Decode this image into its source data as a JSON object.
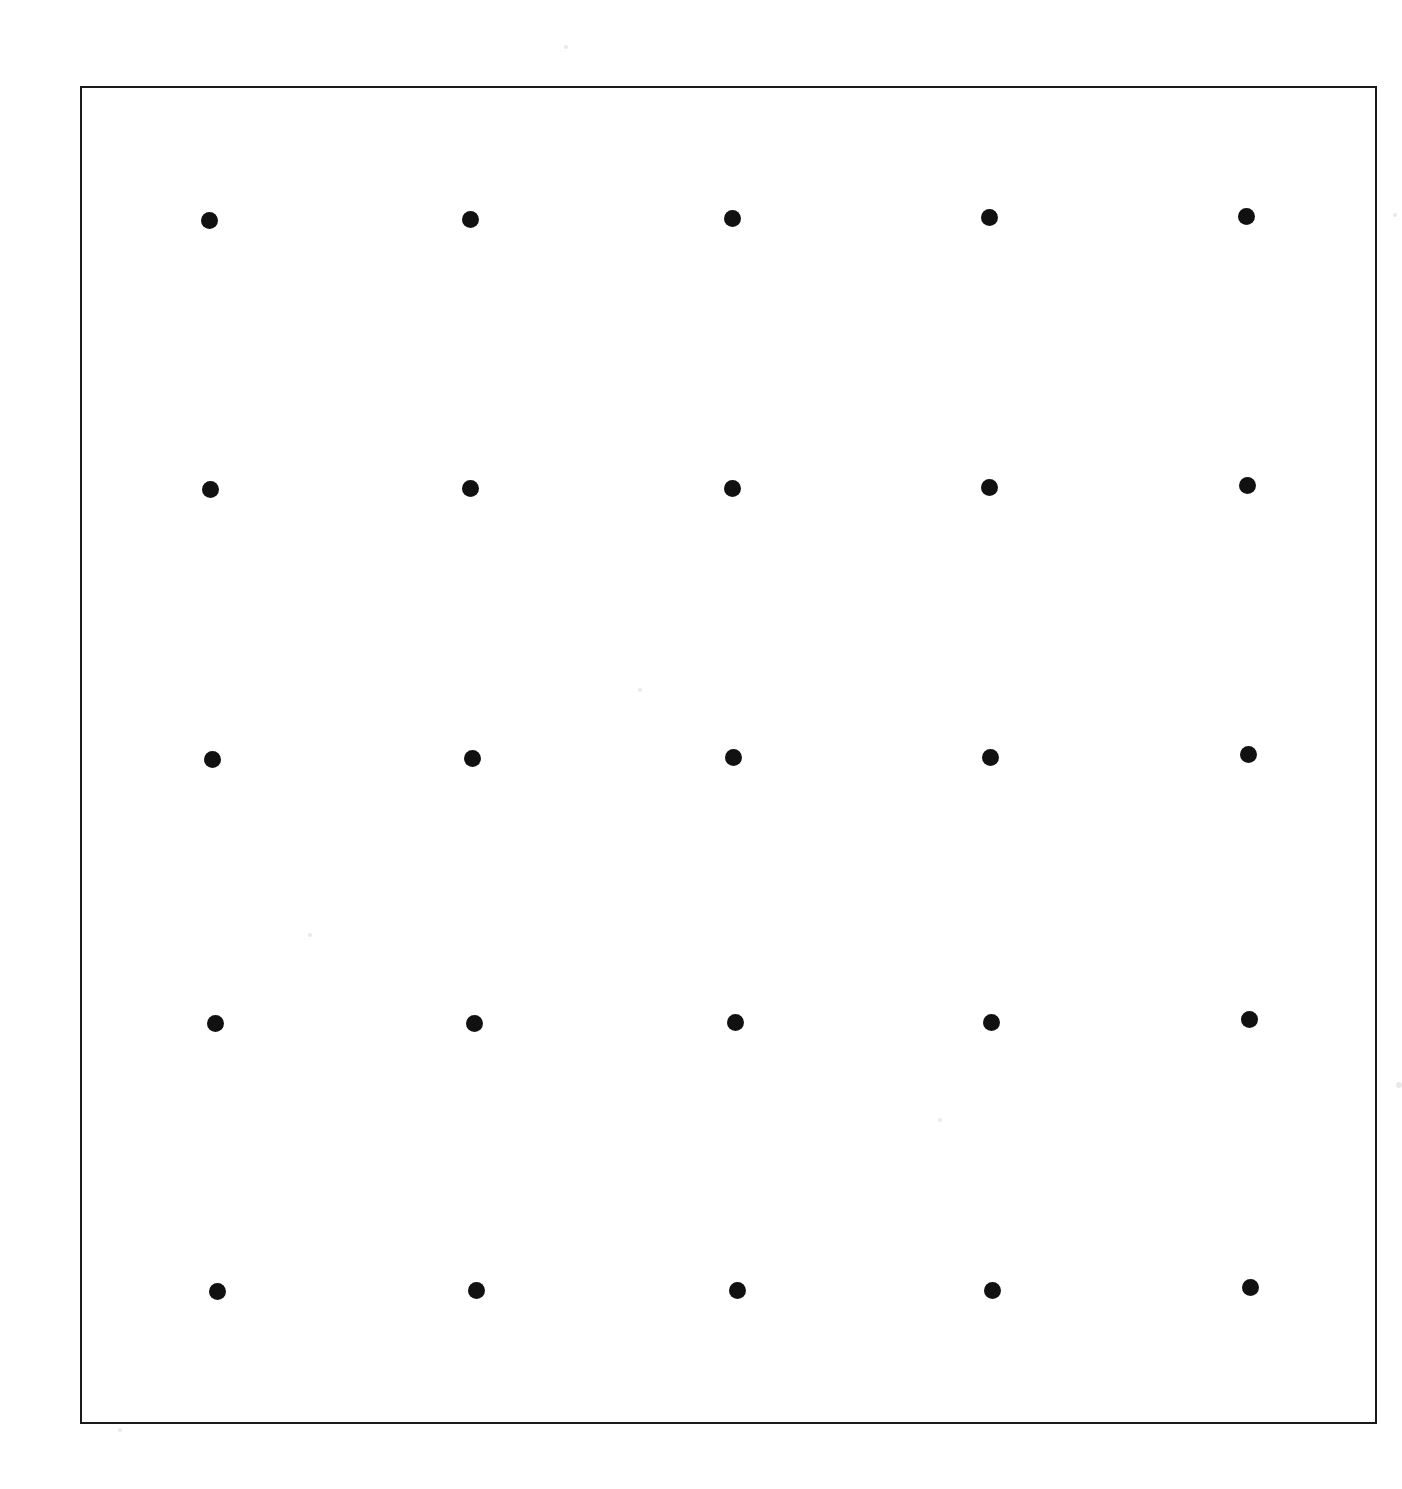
{
  "figure": {
    "name": "dot-grid-figure",
    "caption": "",
    "background_color": "#ffffff",
    "frame": {
      "stroke_color": "#1a1a1a",
      "stroke_width_px": 2,
      "left_px": 80,
      "top_px": 86,
      "width_px": 1297,
      "height_px": 1338
    },
    "dot": {
      "color": "#111111",
      "diameter_px": 17,
      "shape": "circle"
    }
  },
  "chart_data": {
    "type": "scatter",
    "title": "",
    "subtitle": "",
    "xlabel": "",
    "ylabel": "",
    "grid": false,
    "legend": null,
    "axis_visible": false,
    "tick_labels_x": [],
    "tick_labels_y": [],
    "xlim": [
      80,
      1377
    ],
    "ylim": [
      86,
      1424
    ],
    "marker": "filled-circle",
    "marker_color": "#111111",
    "marker_size_px": 17,
    "rows": 5,
    "columns": 5,
    "points": [
      {
        "row": 1,
        "col": 1,
        "x": 209,
        "y": 220
      },
      {
        "row": 1,
        "col": 2,
        "x": 470,
        "y": 219
      },
      {
        "row": 1,
        "col": 3,
        "x": 732,
        "y": 218
      },
      {
        "row": 1,
        "col": 4,
        "x": 989,
        "y": 217
      },
      {
        "row": 1,
        "col": 5,
        "x": 1246,
        "y": 216
      },
      {
        "row": 2,
        "col": 1,
        "x": 210,
        "y": 489
      },
      {
        "row": 2,
        "col": 2,
        "x": 470,
        "y": 488
      },
      {
        "row": 2,
        "col": 3,
        "x": 732,
        "y": 488
      },
      {
        "row": 2,
        "col": 4,
        "x": 989,
        "y": 487
      },
      {
        "row": 2,
        "col": 5,
        "x": 1247,
        "y": 485
      },
      {
        "row": 3,
        "col": 1,
        "x": 212,
        "y": 759
      },
      {
        "row": 3,
        "col": 2,
        "x": 472,
        "y": 758
      },
      {
        "row": 3,
        "col": 3,
        "x": 733,
        "y": 757
      },
      {
        "row": 3,
        "col": 4,
        "x": 990,
        "y": 757
      },
      {
        "row": 3,
        "col": 5,
        "x": 1248,
        "y": 754
      },
      {
        "row": 4,
        "col": 1,
        "x": 215,
        "y": 1023
      },
      {
        "row": 4,
        "col": 2,
        "x": 474,
        "y": 1023
      },
      {
        "row": 4,
        "col": 3,
        "x": 735,
        "y": 1022
      },
      {
        "row": 4,
        "col": 4,
        "x": 991,
        "y": 1022
      },
      {
        "row": 4,
        "col": 5,
        "x": 1249,
        "y": 1019
      },
      {
        "row": 5,
        "col": 1,
        "x": 217,
        "y": 1291
      },
      {
        "row": 5,
        "col": 2,
        "x": 476,
        "y": 1290
      },
      {
        "row": 5,
        "col": 3,
        "x": 737,
        "y": 1290
      },
      {
        "row": 5,
        "col": 4,
        "x": 992,
        "y": 1290
      },
      {
        "row": 5,
        "col": 5,
        "x": 1250,
        "y": 1287
      }
    ]
  },
  "speckles": [
    {
      "x": 566,
      "y": 47,
      "r": 2
    },
    {
      "x": 1399,
      "y": 1085,
      "r": 3
    },
    {
      "x": 120,
      "y": 1430,
      "r": 2
    },
    {
      "x": 1395,
      "y": 215,
      "r": 2
    },
    {
      "x": 640,
      "y": 690,
      "r": 2
    },
    {
      "x": 310,
      "y": 935,
      "r": 2
    },
    {
      "x": 940,
      "y": 1120,
      "r": 2
    }
  ]
}
